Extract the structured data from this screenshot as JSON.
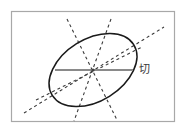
{
  "figure": {
    "canvas": {
      "width": 186,
      "height": 131,
      "background": "#ffffff"
    },
    "frame": {
      "name": "figure-border",
      "x": 11.5,
      "y": 11.5,
      "width": 163,
      "height": 110,
      "stroke": "#a8a8a8",
      "stroke_width": 1.2
    },
    "ellipse": {
      "name": "ellipse-curve",
      "cx": 93,
      "cy": 70,
      "rx": 48,
      "ry": 31,
      "rotation_deg": -32,
      "stroke": "#1a1a1a",
      "stroke_width": 1.5,
      "fill": "none"
    },
    "center_point": {
      "name": "center-dot",
      "cx": 93,
      "cy": 70,
      "r": 1.6,
      "fill": "#404040"
    },
    "solid_chord": {
      "name": "major-chord-line",
      "x1": 55,
      "y1": 70,
      "x2": 133,
      "y2": 70,
      "stroke": "#8a8a8a",
      "stroke_width": 1.8
    },
    "dashed_lines": [
      {
        "name": "dashed-line-long-diagonal",
        "x1": 24,
        "y1": 113,
        "x2": 164,
        "y2": 27,
        "stroke": "#3a3a3a",
        "stroke_width": 1.1,
        "dash": "3 3"
      },
      {
        "name": "dashed-line-steep-left",
        "x1": 67,
        "y1": 19,
        "x2": 117,
        "y2": 120,
        "stroke": "#3a3a3a",
        "stroke_width": 1.1,
        "dash": "3 3"
      },
      {
        "name": "dashed-line-steep-right",
        "x1": 111,
        "y1": 19,
        "x2": 74,
        "y2": 121,
        "stroke": "#3a3a3a",
        "stroke_width": 1.1,
        "dash": "3 3"
      },
      {
        "name": "dashed-line-shallow-lower-left",
        "x1": 36,
        "y1": 100,
        "x2": 142,
        "y2": 47,
        "stroke": "#3a3a3a",
        "stroke_width": 1.1,
        "dash": "3 3"
      }
    ],
    "labels": [
      {
        "name": "tangent-label",
        "text": "切",
        "x": 139,
        "y": 64,
        "color": "#3a3a3a",
        "font_size": 11
      }
    ]
  }
}
